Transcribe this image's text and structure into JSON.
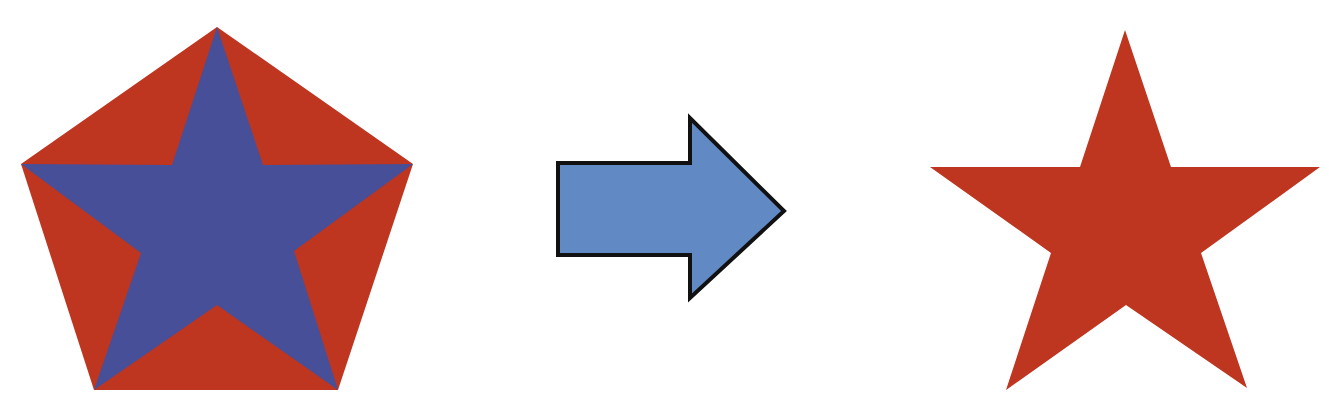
{
  "diagram": {
    "colors": {
      "pentagon_fill": "#be3520",
      "inscribed_star_fill": "#474f98",
      "arrow_fill": "#6189c3",
      "arrow_stroke": "#111111",
      "result_star_fill": "#be3520",
      "background": "#ffffff"
    },
    "left_figure": {
      "shape": "pentagon-with-inscribed-star",
      "pentagon_points": "217,27 413,164 338,390 94,390 21,164",
      "star_points": "217,27 263,165 413,164 294,251 338,390 217,305 94,390 141,253 21,164 172,165"
    },
    "arrow": {
      "shape": "right-arrow",
      "direction": "right",
      "points": "558,163 690,163 690,118 784,211 690,298 690,255 558,255"
    },
    "right_figure": {
      "shape": "five-point-star",
      "star_points": "1125,30 1171,167 1320,167 1201,253 1247,388 1126,305 1006,390 1051,253 930,167 1080,167"
    }
  }
}
